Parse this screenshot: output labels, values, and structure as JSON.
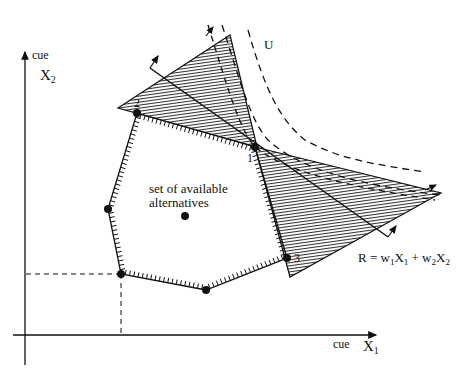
{
  "axes": {
    "x": {
      "label_small": "cue",
      "label_main": "X",
      "label_sub": "1"
    },
    "y": {
      "label_small": "cue",
      "label_main": "X",
      "label_sub": "2"
    }
  },
  "region_label": {
    "line1": "set of available",
    "line2": "alternatives"
  },
  "points": {
    "p1": {
      "label": "1"
    },
    "p2": {
      "label": "2"
    },
    "p3": {
      "label": "3"
    }
  },
  "curve_label": "U",
  "rule": {
    "text_R": "R = w",
    "s1": "1",
    "X1": "X",
    "x1sub": "1",
    "plus": " + w",
    "s2": "2",
    "X2": "X",
    "x2sub": "2"
  },
  "colors": {
    "ink": "#111111",
    "background": "#ffffff"
  }
}
